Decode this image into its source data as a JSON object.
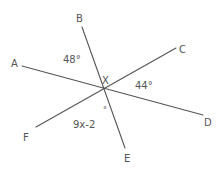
{
  "diagram": {
    "type": "intersecting-lines",
    "intersection_point": "X",
    "lines": [
      {
        "name": "BE",
        "from": "B",
        "to": "E"
      },
      {
        "name": "AD",
        "from": "A",
        "to": "D"
      },
      {
        "name": "CF",
        "from": "C",
        "to": "F"
      }
    ],
    "points": {
      "A": "A",
      "B": "B",
      "C": "C",
      "D": "D",
      "E": "E",
      "F": "F",
      "X": "X"
    },
    "angles": {
      "AXB": "48°",
      "CXD": "44°",
      "FXE": "9x-2",
      "FXE_degree": "°"
    }
  }
}
